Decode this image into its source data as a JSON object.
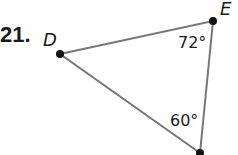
{
  "problem": {
    "number": "21.",
    "vertices": [
      {
        "name": "D",
        "label": "D",
        "x": 60,
        "y": 54
      },
      {
        "name": "E",
        "label": "E",
        "x": 213,
        "y": 21
      },
      {
        "name": "F",
        "label": "",
        "x": 200,
        "y": 153
      }
    ],
    "angles": [
      {
        "vertex": "E",
        "text": "72°",
        "value": 72
      },
      {
        "vertex": "F",
        "text": "60°",
        "value": 60
      }
    ],
    "colors": {
      "line": "#777777",
      "point": "#111111",
      "text": "#1a1a1a"
    }
  }
}
